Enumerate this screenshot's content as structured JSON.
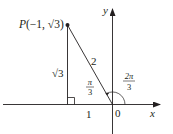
{
  "diagram": {
    "point_label": "P(−1, √3)",
    "point_name": "P",
    "point_coords_open": "(−1, ",
    "point_coords_sqrt": "√3",
    "point_coords_close": ")",
    "axis_x_label": "x",
    "axis_y_label": "y",
    "origin_label": "0",
    "hypotenuse_label": "2",
    "vertical_side_label": "√3",
    "horizontal_side_label": "1",
    "angle_inner": {
      "num": "π",
      "den": "3"
    },
    "angle_outer": {
      "num": "2π",
      "den": "3"
    }
  },
  "colors": {
    "stroke": "#231f20",
    "axis": "#231f20",
    "text": "#231f20"
  }
}
